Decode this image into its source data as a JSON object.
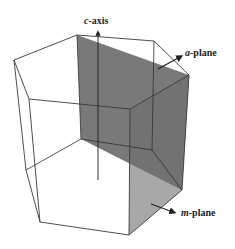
{
  "figure": {
    "type": "hexagonal prism crystal diagram",
    "colors": {
      "background": "#ffffff",
      "edge": "#3a3a3a",
      "a_plane_fill": "#6e6e6e",
      "m_plane_fill": "#a8a8a8",
      "arrow": "#1e1e1e"
    },
    "labels": {
      "c_axis": {
        "italic": "c",
        "rest": "-axis"
      },
      "a_plane": {
        "italic": "a",
        "rest": "-plane"
      },
      "m_plane": {
        "italic": "m",
        "rest": "-plane"
      }
    }
  }
}
